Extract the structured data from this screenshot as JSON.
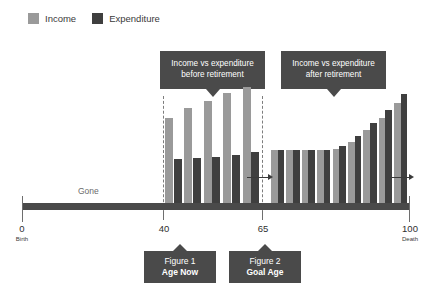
{
  "legend": {
    "items": [
      {
        "label": "Income",
        "color": "#9a9a9a",
        "icon": "income-swatch"
      },
      {
        "label": "Expenditure",
        "color": "#3f3f3f",
        "icon": "expenditure-swatch"
      }
    ]
  },
  "callouts": [
    {
      "id": "before",
      "line1": "Income vs expenditure",
      "line2": "before retirement"
    },
    {
      "id": "after",
      "line1": "Income vs expenditure",
      "line2": "after retirement"
    }
  ],
  "figure_tags": [
    {
      "title": "Figure 1",
      "subtitle": "Age Now"
    },
    {
      "title": "Figure 2",
      "subtitle": "Goal Age"
    }
  ],
  "axis": {
    "gone_label": "Gone",
    "ticks": [
      {
        "value": "0",
        "sub": "Birth"
      },
      {
        "value": "40",
        "sub": ""
      },
      {
        "value": "65",
        "sub": ""
      },
      {
        "value": "100",
        "sub": "Death"
      }
    ]
  },
  "colors": {
    "income": "#9a9a9a",
    "expenditure": "#3f3f3f",
    "axis": "#4a4a4a",
    "callout_bg": "#4a4a4a",
    "background": "#ffffff"
  },
  "chart_data": {
    "type": "bar",
    "title": "",
    "subtitle": "",
    "xlabel": "Age",
    "ylabel": "",
    "grid": false,
    "legend_position": "top-left",
    "x_axis_range": [
      0,
      100
    ],
    "x_tick_labels": [
      "0",
      "40",
      "65",
      "100"
    ],
    "x_tick_sublabels": [
      "Birth",
      "",
      "",
      "Death"
    ],
    "annotations": [
      "Gone",
      "Income vs expenditure before retirement",
      "Income vs expenditure after retirement",
      "Figure 1 / Age Now",
      "Figure 2 / Goal Age"
    ],
    "series": [
      {
        "name": "Income",
        "color": "#9a9a9a",
        "values": [
          62,
          69,
          74,
          80,
          84,
          40,
          40,
          40,
          40,
          46,
          58,
          70,
          80,
          92
        ]
      },
      {
        "name": "Expenditure",
        "color": "#3f3f3f",
        "values": [
          33,
          34,
          35,
          36,
          38,
          40,
          40,
          40,
          40,
          48,
          60,
          72,
          84,
          97
        ]
      }
    ],
    "groups": [
      {
        "name": "before retirement",
        "age_span": [
          40,
          65
        ],
        "bar_pairs": 5,
        "note": "Income exceeds expenditure; bars separated"
      },
      {
        "name": "after retirement",
        "age_span": [
          65,
          100
        ],
        "bar_pairs": 9,
        "note": "Expenditure rises above income over time; bars touching"
      }
    ]
  },
  "bars": {
    "before": [
      {
        "income_h": 88,
        "exp_h": 47
      },
      {
        "income_h": 98,
        "exp_h": 48
      },
      {
        "income_h": 105,
        "exp_h": 49
      },
      {
        "income_h": 113,
        "exp_h": 51
      },
      {
        "income_h": 119,
        "exp_h": 54
      }
    ],
    "after": [
      {
        "income_h": 56,
        "exp_h": 56
      },
      {
        "income_h": 56,
        "exp_h": 56
      },
      {
        "income_h": 56,
        "exp_h": 56
      },
      {
        "income_h": 56,
        "exp_h": 56
      },
      {
        "income_h": 57,
        "exp_h": 60
      },
      {
        "income_h": 64,
        "exp_h": 70
      },
      {
        "income_h": 76,
        "exp_h": 83
      },
      {
        "income_h": 88,
        "exp_h": 96
      },
      {
        "income_h": 103,
        "exp_h": 112
      }
    ]
  }
}
